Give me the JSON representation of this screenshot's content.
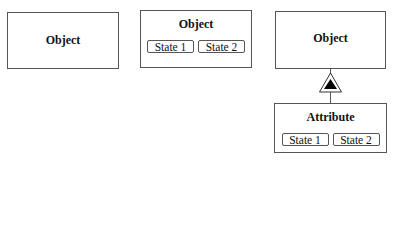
{
  "diagram": {
    "boxes": [
      {
        "id": "object-simple",
        "title": "Object",
        "states": []
      },
      {
        "id": "object-with-states",
        "title": "Object",
        "states": [
          "State 1",
          "State 2"
        ]
      },
      {
        "id": "object-parent",
        "title": "Object",
        "states": []
      },
      {
        "id": "attribute",
        "title": "Attribute",
        "states": [
          "State 1",
          "State 2"
        ]
      }
    ],
    "links": [
      {
        "from": "attribute",
        "to": "object-parent",
        "type": "exhibition",
        "symbol": "triangle-in-triangle"
      }
    ],
    "colors": {
      "stroke": "#555555",
      "fill": "#ffffff",
      "marker": "#000000"
    }
  }
}
